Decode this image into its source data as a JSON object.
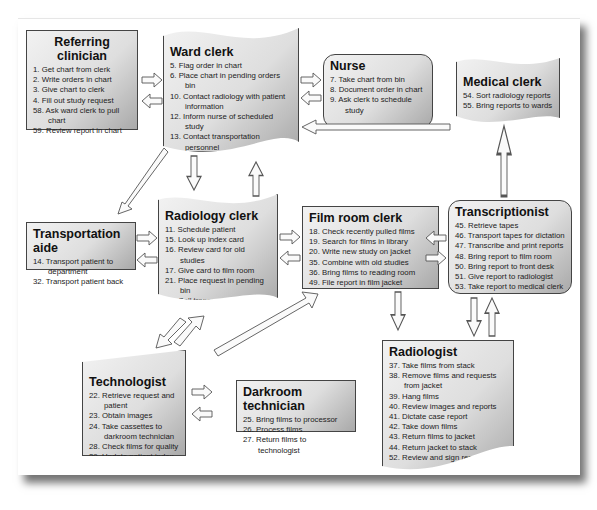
{
  "diagram": {
    "type": "workflow",
    "nodes": [
      {
        "id": "referring_clinician",
        "title": "Referring clinician",
        "items": [
          "1. Get chart from clerk",
          "2. Write orders in chart",
          "3. Give chart to clerk",
          "4. Fill out study request",
          "58. Ask ward clerk to pull chart",
          "59. Review report in chart"
        ]
      },
      {
        "id": "ward_clerk",
        "title": "Ward clerk",
        "items": [
          "5. Flag order in chart",
          "6. Place chart in pending orders bin",
          "10. Contact radiology with patient information",
          "12. Inform nurse of scheduled study",
          "13. Contact transportation personnel",
          "56. Sort reports",
          "57. File reports in chart"
        ]
      },
      {
        "id": "nurse",
        "title": "Nurse",
        "items": [
          "7. Take chart from bin",
          "8. Document order in chart",
          "9. Ask clerk to schedule study"
        ]
      },
      {
        "id": "medical_clerk",
        "title": "Medical clerk",
        "items": [
          "54. Sort radiology reports",
          "55. Bring reports to wards"
        ]
      },
      {
        "id": "transportation_aide",
        "title": "Transportation aide",
        "items": [
          "14. Transport patient to department",
          "32. Transport patient back"
        ]
      },
      {
        "id": "radiology_clerk",
        "title": "Radiology clerk",
        "items": [
          "11. Schedule patient",
          "15. Look up index card",
          "16. Review card for old studies",
          "17. Give card to film room",
          "21. Place request in pending bin",
          "31. Call transportation",
          "33. Re-file index card"
        ]
      },
      {
        "id": "film_room_clerk",
        "title": "Film room clerk",
        "items": [
          "18. Check recently pulled films",
          "19. Search for films in library",
          "20. Write new study on jacket",
          "35. Combine with old studies",
          "36. Bring films to reading room",
          "49. File report in film jacket"
        ]
      },
      {
        "id": "transcriptionist",
        "title": "Transcriptionist",
        "items": [
          "45. Retrieve tapes",
          "46. Transport tapes for dictation",
          "47. Transcribe and print reports",
          "48. Bring report to film room",
          "50. Bring report to front desk",
          "51. Give report to radiologist",
          "53. Take report to medical clerk"
        ]
      },
      {
        "id": "technologist",
        "title": "Technologist",
        "items": [
          "22. Retrieve request and patient",
          "23. Obtain images",
          "24. Take cassettes to darkroom technician",
          "28. Check films for quality",
          "29. Update patient index card",
          "30. Return study card to clerk",
          "34. Bring films to film room"
        ]
      },
      {
        "id": "darkroom_technician",
        "title": "Darkroom technician",
        "items": [
          "25. Bring films to processor",
          "26. Process films",
          "27. Return films to technologist"
        ]
      },
      {
        "id": "radiologist",
        "title": "Radiologist",
        "items": [
          "37. Take films from stack",
          "38. Remove films and requests from jacket",
          "39. Hang films",
          "40. Review images and reports",
          "41. Dictate case report",
          "42. Take down films",
          "43. Return films to jacket",
          "44. Return jacket to stack",
          "52. Review and sign report"
        ]
      }
    ],
    "edges": [
      [
        "referring_clinician",
        "ward_clerk"
      ],
      [
        "ward_clerk",
        "referring_clinician"
      ],
      [
        "ward_clerk",
        "nurse"
      ],
      [
        "nurse",
        "ward_clerk"
      ],
      [
        "medical_clerk",
        "ward_clerk"
      ],
      [
        "ward_clerk",
        "transportation_aide"
      ],
      [
        "ward_clerk",
        "radiology_clerk"
      ],
      [
        "radiology_clerk",
        "ward_clerk"
      ],
      [
        "transportation_aide",
        "radiology_clerk"
      ],
      [
        "radiology_clerk",
        "transportation_aide"
      ],
      [
        "radiology_clerk",
        "film_room_clerk"
      ],
      [
        "film_room_clerk",
        "radiology_clerk"
      ],
      [
        "transcriptionist",
        "film_room_clerk"
      ],
      [
        "film_room_clerk",
        "transcriptionist"
      ],
      [
        "transcriptionist",
        "medical_clerk"
      ],
      [
        "film_room_clerk",
        "radiologist"
      ],
      [
        "transcriptionist",
        "radiologist"
      ],
      [
        "radiologist",
        "transcriptionist"
      ],
      [
        "radiology_clerk",
        "technologist"
      ],
      [
        "technologist",
        "radiology_clerk"
      ],
      [
        "technologist",
        "film_room_clerk"
      ],
      [
        "technologist",
        "darkroom_technician"
      ],
      [
        "darkroom_technician",
        "technologist"
      ]
    ]
  }
}
